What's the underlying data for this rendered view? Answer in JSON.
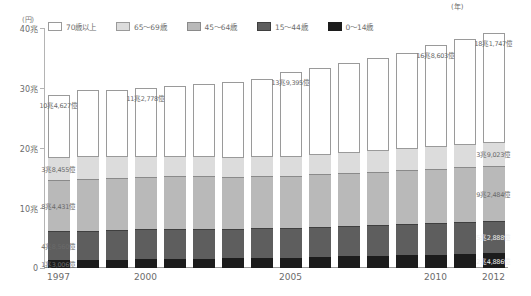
{
  "axis": {
    "unit_label": "(円)",
    "x_unit_label": "(年)",
    "y_ticks": [
      "0",
      "10兆",
      "20兆",
      "30兆",
      "40兆"
    ],
    "y_tick_values": [
      0,
      10,
      20,
      30,
      40
    ],
    "x_tick_labels": [
      "1997",
      "2000",
      "2005",
      "2010",
      "2012"
    ]
  },
  "legend": {
    "items": [
      {
        "label": "70歳以上",
        "color": "#ffffff",
        "border": "#9a9a9a"
      },
      {
        "label": "65〜69歳",
        "color": "#dcdcdc",
        "border": "#9a9a9a"
      },
      {
        "label": "45〜64歳",
        "color": "#b9b9b9",
        "border": "#8a8a8a"
      },
      {
        "label": "15〜44歳",
        "color": "#5e5e5e",
        "border": "#3f3f3f"
      },
      {
        "label": "0〜14歳",
        "color": "#1c1c1c",
        "border": "#1c1c1c"
      }
    ]
  },
  "chart_data": {
    "type": "bar",
    "stacked": true,
    "title": "",
    "xlabel": "(年)",
    "ylabel": "(円)",
    "ylim": [
      0,
      40
    ],
    "grid": false,
    "legend_position": "top",
    "categories": [
      "1997",
      "1998",
      "1999",
      "2000",
      "2001",
      "2002",
      "2003",
      "2004",
      "2005",
      "2006",
      "2007",
      "2008",
      "2009",
      "2010",
      "2011",
      "2012"
    ],
    "series": [
      {
        "name": "0〜14歳",
        "values": [
          1.3,
          1.35,
          1.4,
          1.45,
          1.5,
          1.55,
          1.6,
          1.7,
          1.75,
          1.85,
          1.95,
          2.05,
          2.15,
          2.25,
          2.35,
          2.49
        ]
      },
      {
        "name": "15〜44歳",
        "values": [
          4.85,
          4.9,
          4.95,
          5.0,
          5.0,
          5.0,
          4.95,
          4.95,
          4.95,
          5.0,
          5.05,
          5.1,
          5.15,
          5.2,
          5.25,
          5.29
        ]
      },
      {
        "name": "45〜64歳",
        "values": [
          8.44,
          8.6,
          8.7,
          8.8,
          8.8,
          8.75,
          8.7,
          8.7,
          8.7,
          8.75,
          8.8,
          8.9,
          9.0,
          9.1,
          9.18,
          9.25
        ]
      },
      {
        "name": "65〜69歳",
        "values": [
          3.85,
          3.75,
          3.6,
          3.5,
          3.4,
          3.35,
          3.3,
          3.3,
          3.35,
          3.4,
          3.5,
          3.6,
          3.7,
          3.8,
          3.85,
          3.9
        ]
      },
      {
        "name": "70歳以上",
        "values": [
          10.46,
          11.0,
          11.1,
          11.28,
          11.6,
          12.0,
          12.4,
          12.8,
          13.94,
          14.4,
          14.9,
          15.3,
          15.9,
          16.86,
          17.5,
          18.17
        ]
      }
    ],
    "annotations": [
      {
        "year": "1997",
        "text": "10兆4,627億",
        "segment": "70歳以上",
        "tone": "dark"
      },
      {
        "year": "1997",
        "text": "3兆8,455億",
        "segment": "65〜69歳",
        "tone": "dark"
      },
      {
        "year": "1997",
        "text": "8兆4,431億",
        "segment": "45〜64歳",
        "tone": "dark"
      },
      {
        "year": "1997",
        "text": "4兆8,560億",
        "segment": "15〜44歳",
        "tone": "dark"
      },
      {
        "year": "1997",
        "text": "1兆3,006億",
        "segment": "0〜14歳",
        "tone": "dark"
      },
      {
        "year": "2000",
        "text": "11兆2,778億",
        "segment": "70歳以上",
        "tone": "dark"
      },
      {
        "year": "2005",
        "text": "13兆9,395億",
        "segment": "70歳以上",
        "tone": "dark"
      },
      {
        "year": "2010",
        "text": "16兆8,603億",
        "segment": "70歳以上",
        "tone": "dark"
      },
      {
        "year": "2012",
        "text": "18兆1,747億",
        "segment": "70歳以上",
        "tone": "dark"
      },
      {
        "year": "2012",
        "text": "3兆9,023億",
        "segment": "65〜69歳",
        "tone": "dark"
      },
      {
        "year": "2012",
        "text": "9兆2,484億",
        "segment": "45〜64歳",
        "tone": "dark"
      },
      {
        "year": "2012",
        "text": "5兆2,888億",
        "segment": "15〜44歳",
        "tone": "light"
      },
      {
        "year": "2012",
        "text": "2兆4,886億",
        "segment": "0〜14歳",
        "tone": "light"
      }
    ]
  }
}
